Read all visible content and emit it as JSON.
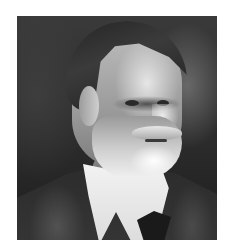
{
  "image": {
    "kind": "black-and-white photographic portrait",
    "subject": "elderly man with swept-back dark hair, white beard and moustache, white collar, dark bow tie and dark jacket",
    "background_color": "#ffffff",
    "photo_frame": {
      "left": 17,
      "top": 16,
      "width": 200,
      "height": 224
    },
    "palette": {
      "background_dark": "#2a2a2a",
      "hair": "#252525",
      "face_light": "#e6e6e6",
      "beard": "#f0f0f0",
      "collar": "#f2f2f2",
      "jacket": "#303030",
      "tie": "#1a1a1a"
    }
  }
}
